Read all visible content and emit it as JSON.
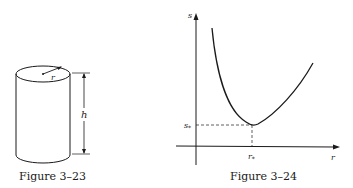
{
  "figures": [
    {
      "id": "fig-3-23",
      "caption": "Figure 3–23",
      "labels": {
        "radius": "r",
        "height": "h"
      },
      "description": "Closed right circular cylinder with radius r and height h"
    },
    {
      "id": "fig-3-24",
      "caption": "Figure 3–24",
      "labels": {
        "y_axis": "s",
        "x_axis": "r",
        "min_y": "s",
        "min_y_sub": "*",
        "min_x": "r",
        "min_x_sub": "*"
      },
      "description": "Convex curve s(r) with minimum at (r*, s*)"
    }
  ],
  "colors": {
    "ink": "#1a1a1a",
    "background": "#ffffff"
  }
}
